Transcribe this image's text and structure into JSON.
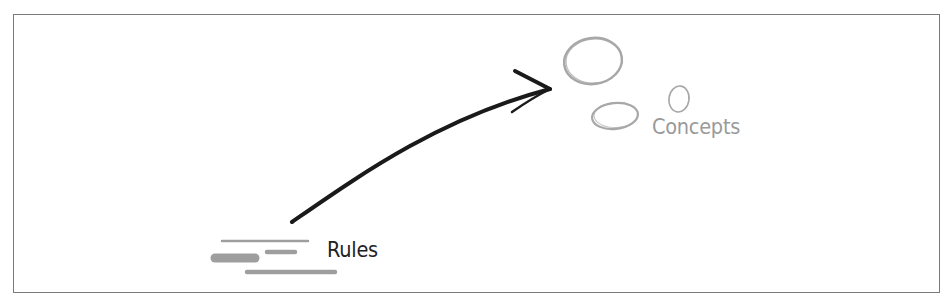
{
  "diagram": {
    "labels": {
      "concepts": "Concepts",
      "rules": "Rules"
    },
    "colors": {
      "frame": "#7a7a7a",
      "arrow": "#1a1a1a",
      "concepts_text": "#9a9a9a",
      "concept_shapes": "#a8a8a8",
      "rules_text": "#222222",
      "rule_lines": "#9e9e9e"
    },
    "nodes": [
      {
        "id": "rules",
        "label": "Rules",
        "icon": "rules-lines-icon"
      },
      {
        "id": "concepts",
        "label": "Concepts",
        "icon": "concept-ovals-icon"
      }
    ],
    "edges": [
      {
        "from": "rules",
        "to": "concepts",
        "style": "hand-drawn-arrow"
      }
    ]
  }
}
